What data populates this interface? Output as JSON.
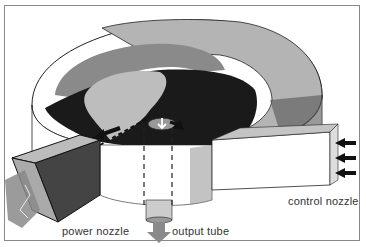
{
  "diagram": {
    "labels": {
      "power_nozzle": "power nozzle",
      "output_tube": "output tube",
      "control_nozzle": "control nozzle"
    },
    "components": [
      "vortex chamber",
      "power nozzle",
      "control nozzle",
      "output tube"
    ],
    "colors": {
      "chamber_top": "#b8b8b8",
      "chamber_dark": "#1a1a1a",
      "vortex_gray": "#8a8a8a",
      "arrows": "#111111",
      "flow_arrow": "#9a9a9a"
    }
  }
}
